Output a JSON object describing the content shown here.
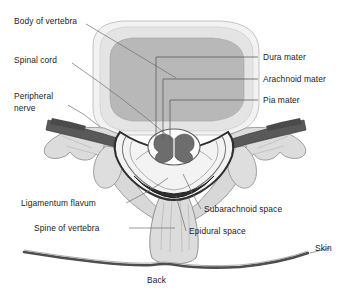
{
  "figure": {
    "title_caption": "Back",
    "background_color": "#ffffff",
    "text_color": "#1b1b1b",
    "leader_line_color": "#6e6e6e"
  },
  "labels": {
    "body_of_vertebra": "Body of vertebra",
    "spinal_cord": "Spinal cord",
    "peripheral_nerve_line1": "Peripheral",
    "peripheral_nerve_line2": "nerve",
    "dura_mater": "Dura mater",
    "arachnoid_mater": "Arachnoid mater",
    "pia_mater": "Pia mater",
    "ligamentum_flavum": "Ligamentum flavum",
    "spine_of_vertebra": "Spine of vertebra",
    "subarachnoid_space": "Subarachnoid space",
    "epidural_space": "Epidural space",
    "skin": "Skin",
    "back": "Back"
  },
  "structures": {
    "vertebral_body_outer": "vertebral-body-outer-cortex",
    "vertebral_body_inner": "vertebral-body-cancellous",
    "spinal_cord": "spinal-cord-butterfly-gray-matter",
    "dura_sac": "dura-mater-sac",
    "peripheral_nerve": "peripheral-nerve-root",
    "transverse_process_left": "transverse-process-left",
    "transverse_process_right": "transverse-process-right",
    "spinous_process": "spinous-process",
    "ligamentum_flavum": "ligamentum-flavum-band",
    "skin_surface": "skin-surface-line"
  },
  "colors": {
    "body_outer": "#ededed",
    "body_inner": "#b6b6b6",
    "bone_fill": "#dcdcdc",
    "bone_stroke": "#8a8a8a",
    "nerve_dark": "#5e5e5e",
    "dura_dark": "#2b2b2b",
    "cord_fill": "#f7f7f7",
    "gray_matter": "#6b6b6b",
    "skin_line": "#4a4a4a"
  }
}
